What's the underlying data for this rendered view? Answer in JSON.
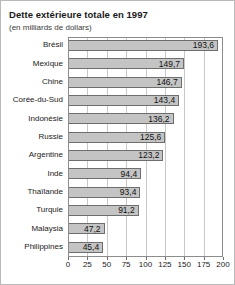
{
  "chart_data": {
    "type": "bar",
    "orientation": "horizontal",
    "title": "Dette extérieure totale en 1997",
    "subtitle": "(en milliards de dollars)",
    "xlabel": "",
    "ylabel": "",
    "xlim": [
      0,
      200
    ],
    "grid": true,
    "legend": null,
    "xticks": [
      "0",
      "25",
      "50",
      "75",
      "100",
      "125",
      "150",
      "175",
      "200"
    ],
    "xtick_values": [
      0,
      25,
      50,
      75,
      100,
      125,
      150,
      175,
      200
    ],
    "categories": [
      "Brésil",
      "Mexique",
      "Chine",
      "Corée-du-Sud",
      "Indonésie",
      "Russie",
      "Argentine",
      "Inde",
      "Thaïlande",
      "Turquie",
      "Malaysia",
      "Philippines"
    ],
    "values": [
      193.6,
      149.7,
      146.7,
      143.4,
      136.2,
      125.6,
      123.2,
      94.4,
      93.4,
      91.2,
      47.2,
      45.4
    ],
    "value_labels": [
      "193,6",
      "149,7",
      "146,7",
      "143,4",
      "136,2",
      "125,6",
      "123,2",
      "94,4",
      "93,4",
      "91,2",
      "47,2",
      "45,4"
    ],
    "colors": {
      "bar_fill": "#c4c4c4",
      "bar_edge": "#6e6e6e",
      "gridline": "#c8c8c8",
      "axis": "#8c8c8c",
      "text": "#1a1a1a",
      "frame": "#b9b9b9",
      "background": "#ffffff"
    }
  }
}
